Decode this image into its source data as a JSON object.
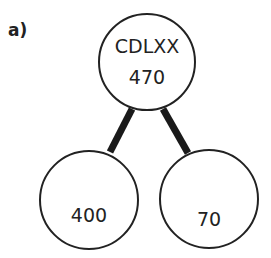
{
  "part_label": "a)",
  "nodes": {
    "root": {
      "top_text": "CDLXX",
      "bottom_text": "470"
    },
    "left": {
      "text": "400"
    },
    "right": {
      "text": "70"
    }
  },
  "colors": {
    "stroke": "#222222",
    "connector": "#1a1a1a",
    "background": "#ffffff"
  }
}
